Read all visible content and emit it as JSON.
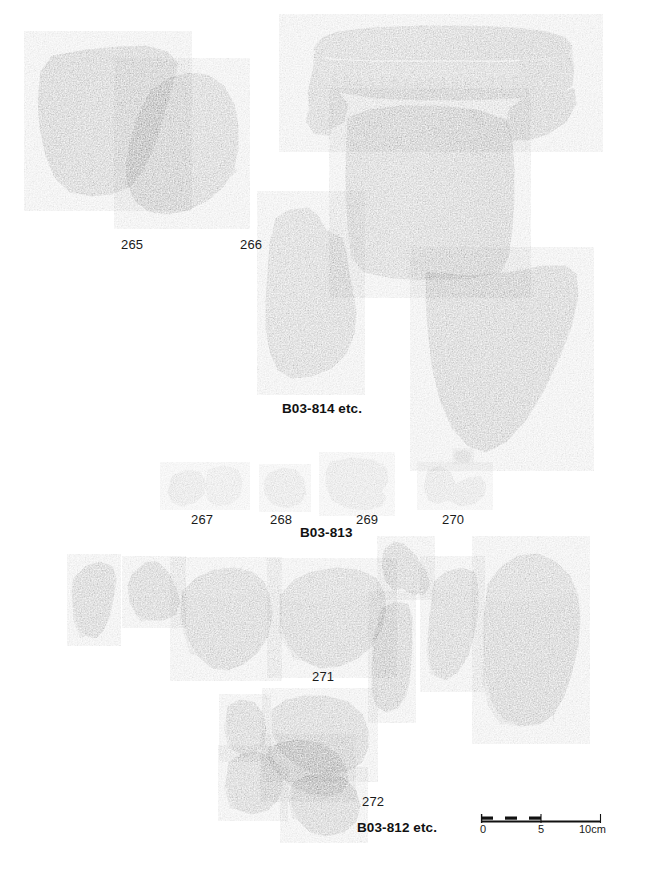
{
  "plate": {
    "background_color": "#ffffff",
    "width": 661,
    "height": 870,
    "type": "archaeological-pottery-photo-plate"
  },
  "groups": [
    {
      "id": "group-b03-814",
      "caption": "B03-814 etc.",
      "caption_x": 282,
      "caption_y": 402,
      "item_labels": [
        {
          "text": "265",
          "x": 121,
          "y": 238
        },
        {
          "text": "266",
          "x": 240,
          "y": 238
        }
      ]
    },
    {
      "id": "group-b03-813",
      "caption": "B03-813",
      "caption_x": 300,
      "caption_y": 526,
      "item_labels": [
        {
          "text": "267",
          "x": 191,
          "y": 513
        },
        {
          "text": "268",
          "x": 270,
          "y": 513
        },
        {
          "text": "269",
          "x": 356,
          "y": 513
        },
        {
          "text": "270",
          "x": 442,
          "y": 513
        }
      ]
    },
    {
      "id": "group-b03-812",
      "caption": "B03-812 etc.",
      "caption_x": 357,
      "caption_y": 821,
      "item_labels": [
        {
          "text": "271",
          "x": 312,
          "y": 670
        },
        {
          "text": "272",
          "x": 362,
          "y": 795
        }
      ]
    }
  ],
  "scale_bar": {
    "x": 480,
    "y": 814,
    "length_px": 120,
    "units": "cm",
    "max_value": 10,
    "tick_labels": [
      {
        "text": "0",
        "value": 0
      },
      {
        "text": "5",
        "value": 5
      },
      {
        "text": "10cm",
        "value": 10
      }
    ],
    "bar_color": "#111111",
    "rule_color": "#111111"
  },
  "sherds": {
    "note": "monochrome photographic pottery fragments",
    "tone_dark": "#3a3a3a",
    "tone_mid": "#6e6e6e",
    "tone_light": "#a6a6a6",
    "tone_pale": "#c9c9c9"
  }
}
